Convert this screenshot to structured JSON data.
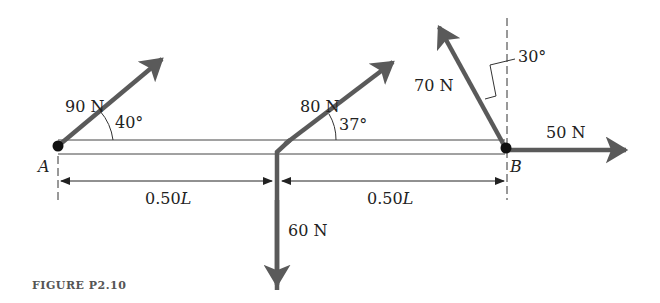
{
  "figure": {
    "caption": "FIGURE P2.10",
    "points": {
      "A": "A",
      "B": "B"
    },
    "forces": [
      {
        "id": "f90",
        "label": "90 N",
        "angle_label": "40°",
        "at": "A",
        "direction_deg_from_horizontal": 40
      },
      {
        "id": "f80",
        "label": "80 N",
        "angle_label": "37°",
        "at": "midpoint",
        "direction_deg_from_horizontal": 37
      },
      {
        "id": "f60",
        "label": "60 N",
        "at": "midpoint",
        "direction": "down"
      },
      {
        "id": "f70",
        "label": "70 N",
        "angle_label": "30°",
        "at": "B",
        "direction_deg_from_vertical": 30
      },
      {
        "id": "f50",
        "label": "50 N",
        "at": "B",
        "direction": "right"
      }
    ],
    "dimensions": [
      {
        "id": "d1",
        "label_num": "0.50",
        "label_var": "L"
      },
      {
        "id": "d2",
        "label_num": "0.50",
        "label_var": "L"
      }
    ],
    "colors": {
      "arrow": "#5a5a5a",
      "line": "#333333",
      "text": "#222222",
      "caption": "#555555"
    }
  }
}
